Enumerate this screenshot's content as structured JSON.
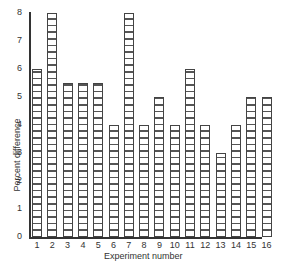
{
  "chart_data": {
    "type": "bar",
    "title": "",
    "xlabel": "Experiment number",
    "ylabel": "Percent difference",
    "categories": [
      "1",
      "2",
      "3",
      "4",
      "5",
      "6",
      "7",
      "8",
      "9",
      "10",
      "11",
      "12",
      "13",
      "14",
      "15",
      "16"
    ],
    "values": [
      6,
      8,
      5.5,
      5.5,
      5.5,
      4,
      8,
      4,
      5,
      4,
      6,
      4,
      3,
      4,
      5,
      5
    ],
    "ylim": [
      0,
      8
    ],
    "yticks": [
      "0",
      "1",
      "2",
      "3",
      "4",
      "5",
      "6",
      "7",
      "8"
    ],
    "grid": false,
    "legend": null,
    "bar_fill": "horizontal-hatch",
    "colors": {
      "bar_border": "#444444",
      "hatch": "#555555",
      "axis": "#333333"
    }
  }
}
